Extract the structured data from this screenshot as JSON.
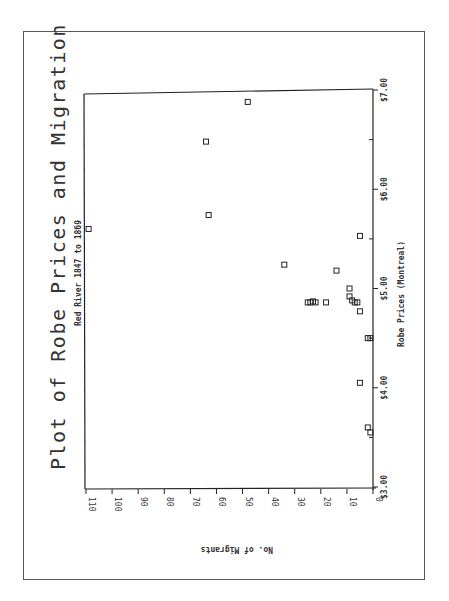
{
  "chart_data": {
    "type": "scatter",
    "orientation": "rotated 90deg counter-clockwise on page",
    "title": "Plot of Robe Prices and Migration",
    "subtitle": "Red River 1847 to 1869",
    "xlabel": "Robe Prices (Montreal)",
    "ylabel": "No. of Migrants",
    "xlim": [
      3.0,
      7.0
    ],
    "ylim": [
      0,
      110
    ],
    "x_ticks": [
      "$3.00",
      "$4.00",
      "$5.00",
      "$6.00",
      "$7.00"
    ],
    "x_tick_values": [
      3.0,
      4.0,
      5.0,
      6.0,
      7.0
    ],
    "x_minor_ticks": [
      3.5,
      4.5,
      5.5,
      6.5
    ],
    "y_ticks": [
      "0",
      "10",
      "20",
      "30",
      "40",
      "50",
      "60",
      "70",
      "80",
      "90",
      "100",
      "110"
    ],
    "y_tick_values": [
      0,
      10,
      20,
      30,
      40,
      50,
      60,
      70,
      80,
      90,
      100,
      110
    ],
    "grid": false,
    "legend": null,
    "marker": "open-square",
    "points": [
      {
        "x": 6.88,
        "y": 48
      },
      {
        "x": 6.48,
        "y": 64
      },
      {
        "x": 5.74,
        "y": 63
      },
      {
        "x": 5.6,
        "y": 109
      },
      {
        "x": 5.53,
        "y": 5
      },
      {
        "x": 5.24,
        "y": 34
      },
      {
        "x": 5.18,
        "y": 14
      },
      {
        "x": 5.0,
        "y": 9
      },
      {
        "x": 4.92,
        "y": 9
      },
      {
        "x": 4.88,
        "y": 8
      },
      {
        "x": 4.86,
        "y": 7
      },
      {
        "x": 4.86,
        "y": 6
      },
      {
        "x": 4.86,
        "y": 25
      },
      {
        "x": 4.86,
        "y": 24
      },
      {
        "x": 4.87,
        "y": 23
      },
      {
        "x": 4.86,
        "y": 22
      },
      {
        "x": 4.86,
        "y": 18
      },
      {
        "x": 4.77,
        "y": 5
      },
      {
        "x": 4.5,
        "y": 2
      },
      {
        "x": 4.5,
        "y": 1
      },
      {
        "x": 4.05,
        "y": 5
      },
      {
        "x": 3.6,
        "y": 2
      },
      {
        "x": 3.55,
        "y": 1
      }
    ]
  }
}
